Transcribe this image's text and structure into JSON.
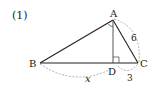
{
  "problem_label": "(1)",
  "diagram": {
    "type": "right-triangle-with-altitude",
    "vertices": {
      "A": {
        "label": "A"
      },
      "B": {
        "label": "B"
      },
      "C": {
        "label": "C"
      },
      "D": {
        "label": "D"
      }
    },
    "measurements": {
      "AC": "6",
      "DC": "3",
      "BD": "x"
    },
    "marks": {
      "right_angle_at": "D",
      "angle_mark_at": "A"
    },
    "colors": {
      "line": "#222222",
      "dashed": "#9a9a9a"
    }
  }
}
